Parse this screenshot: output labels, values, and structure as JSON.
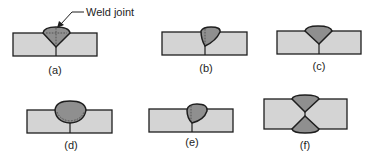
{
  "diagram": {
    "callout": {
      "text": "Weld joint",
      "points_to": "a"
    },
    "colors": {
      "plate_fill": "#d4d4d4",
      "bead_fill": "#8f8f8f",
      "outline": "#1e1e1e",
      "background": "#ffffff"
    },
    "panels": [
      {
        "id": "a",
        "label": "(a)",
        "bead_shape": "V-groove, full penetration, with dashed fusion line"
      },
      {
        "id": "b",
        "label": "(b)",
        "bead_shape": "Offset single-sided bead, partial"
      },
      {
        "id": "c",
        "label": "(c)",
        "bead_shape": "V-groove, symmetric"
      },
      {
        "id": "d",
        "label": "(d)",
        "bead_shape": "U-shaped rounded bead, with dashed fusion line"
      },
      {
        "id": "e",
        "label": "(e)",
        "bead_shape": "Offset rounded bead"
      },
      {
        "id": "f",
        "label": "(f)",
        "bead_shape": "Double-V (both sides), meeting at center"
      }
    ]
  }
}
